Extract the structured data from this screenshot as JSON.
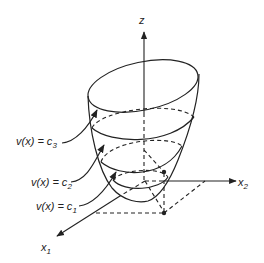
{
  "figure": {
    "axes": {
      "z_label": "z",
      "x1_label": "x",
      "x1_sub": "1",
      "x2_label": "x",
      "x2_sub": "2"
    },
    "level_sets": [
      {
        "id": "c3",
        "prefix": "v(x) = c",
        "sub": "3"
      },
      {
        "id": "c2",
        "prefix": "v(x) = c",
        "sub": "2"
      },
      {
        "id": "c1",
        "prefix": "v(x) = c",
        "sub": "1"
      }
    ],
    "colors": {
      "line": "#222222",
      "background": "#ffffff"
    }
  }
}
